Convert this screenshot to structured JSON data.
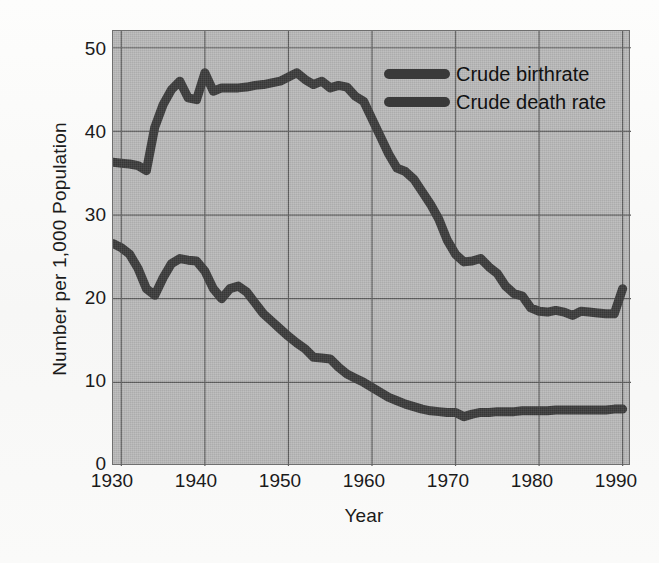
{
  "figure": {
    "background_color": "#fbfbfa",
    "plot_background_color": "#b9b9b9",
    "line_color": "#3a3a3a",
    "grid_color": "#5f5f5f"
  },
  "chart_data": {
    "type": "line",
    "title": "",
    "xlabel": "Year",
    "ylabel": "Number per 1,000 Population",
    "xlim": [
      1929,
      1991
    ],
    "ylim": [
      0,
      52
    ],
    "xticks": [
      1930,
      1940,
      1950,
      1960,
      1970,
      1980,
      1990
    ],
    "yticks": [
      0,
      10,
      20,
      30,
      40,
      50
    ],
    "grid": true,
    "legend_position": "top-right",
    "x": [
      1929,
      1930,
      1931,
      1932,
      1933,
      1934,
      1935,
      1936,
      1937,
      1938,
      1939,
      1940,
      1941,
      1942,
      1943,
      1944,
      1945,
      1946,
      1947,
      1948,
      1949,
      1950,
      1951,
      1952,
      1953,
      1954,
      1955,
      1956,
      1957,
      1958,
      1959,
      1960,
      1961,
      1962,
      1963,
      1964,
      1965,
      1966,
      1967,
      1968,
      1969,
      1970,
      1971,
      1972,
      1973,
      1974,
      1975,
      1976,
      1977,
      1978,
      1979,
      1980,
      1981,
      1982,
      1983,
      1984,
      1985,
      1986,
      1987,
      1988,
      1989,
      1990
    ],
    "series": [
      {
        "name": "Crude birthrate",
        "color": "#3a3a3a",
        "values": [
          36.3,
          36.2,
          36.1,
          35.9,
          35.3,
          40.5,
          43.2,
          45.0,
          46.0,
          44.0,
          43.8,
          47.0,
          44.8,
          45.2,
          45.2,
          45.2,
          45.3,
          45.5,
          45.6,
          45.8,
          46.0,
          46.5,
          47.0,
          46.2,
          45.6,
          46.0,
          45.2,
          45.5,
          45.3,
          44.2,
          43.6,
          41.5,
          39.4,
          37.3,
          35.6,
          35.2,
          34.3,
          32.8,
          31.3,
          29.5,
          27.0,
          25.3,
          24.4,
          24.5,
          24.8,
          23.8,
          23.0,
          21.5,
          20.6,
          20.3,
          18.9,
          18.5,
          18.4,
          18.6,
          18.4,
          18.0,
          18.5,
          18.4,
          18.3,
          18.2,
          18.2,
          21.2
        ]
      },
      {
        "name": "Crude death rate",
        "color": "#3a3a3a",
        "values": [
          26.6,
          26.1,
          25.3,
          23.6,
          21.2,
          20.4,
          22.5,
          24.2,
          24.8,
          24.6,
          24.5,
          23.3,
          21.2,
          20.0,
          21.2,
          21.5,
          20.8,
          19.5,
          18.2,
          17.3,
          16.4,
          15.5,
          14.7,
          14.0,
          13.0,
          12.9,
          12.8,
          11.8,
          11.0,
          10.5,
          10.0,
          9.4,
          8.8,
          8.2,
          7.8,
          7.4,
          7.1,
          6.8,
          6.6,
          6.5,
          6.4,
          6.4,
          5.9,
          6.2,
          6.4,
          6.4,
          6.5,
          6.5,
          6.5,
          6.6,
          6.6,
          6.6,
          6.6,
          6.7,
          6.7,
          6.7,
          6.7,
          6.7,
          6.7,
          6.7,
          6.8,
          6.8
        ]
      }
    ],
    "legend": [
      {
        "label": "Crude birthrate",
        "swatch_color": "#3a3a3a"
      },
      {
        "label": "Crude death rate",
        "swatch_color": "#3a3a3a"
      }
    ],
    "tick_labels": {
      "x": [
        "1930",
        "1940",
        "1950",
        "1960",
        "1970",
        "1980",
        "1990"
      ],
      "y": [
        "0",
        "10",
        "20",
        "30",
        "40",
        "50"
      ]
    }
  }
}
